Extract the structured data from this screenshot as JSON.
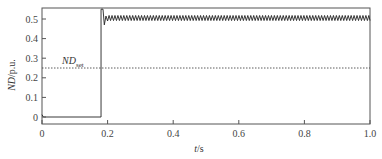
{
  "chart_data": {
    "type": "line",
    "title": "",
    "xlabel": "t/s",
    "ylabel": "ND/p.u.",
    "xlim": [
      0,
      1.0
    ],
    "ylim": [
      -0.05,
      0.55
    ],
    "xticks": [
      "0",
      "0.2",
      "0.4",
      "0.6",
      "0.8",
      "1.0"
    ],
    "xtick_values": [
      0,
      0.2,
      0.4,
      0.6,
      0.8,
      1.0
    ],
    "yticks": [
      "0",
      "0.1",
      "0.2",
      "0.3",
      "0.4",
      "0.5"
    ],
    "ytick_values": [
      0,
      0.1,
      0.2,
      0.3,
      0.4,
      0.5
    ],
    "grid": false,
    "series": [
      {
        "name": "ND",
        "style": "solid",
        "color": "#222222",
        "description": "Stays at ~0 from t=0 to t≈0.18 s, steps up to ~0.55 with an overshoot, then oscillates around ~0.50 (between ~0.49 and ~0.52) until t=1.0 s",
        "x": [
          0,
          0.005,
          0.18,
          0.18,
          0.19,
          0.2,
          0.25,
          0.5,
          0.75,
          1.0
        ],
        "y": [
          0.01,
          0.0,
          0.0,
          0.55,
          0.47,
          0.51,
          0.505,
          0.505,
          0.505,
          0.505
        ]
      },
      {
        "name": "ND_set",
        "style": "dashed",
        "color": "#333333",
        "x": [
          0,
          1.0
        ],
        "y": [
          0.25,
          0.25
        ]
      }
    ],
    "annotations": [
      {
        "text": "ND",
        "subscript": "set",
        "x": 0.08,
        "y": 0.28
      }
    ]
  },
  "labels": {
    "xlabel_main": "t",
    "xlabel_unit": "/s",
    "ylabel_main": "ND",
    "ylabel_unit": "/p.u.",
    "annotation_main": "ND",
    "annotation_sub": "set"
  }
}
